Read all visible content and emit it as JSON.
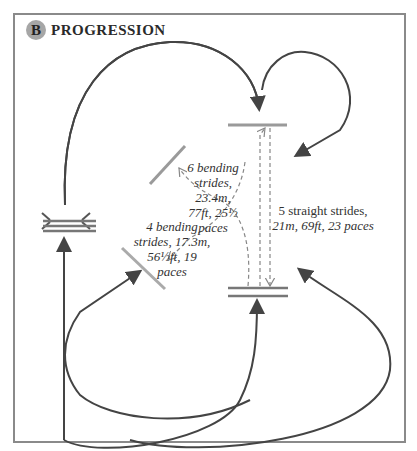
{
  "header": {
    "badge": "B",
    "title": "PROGRESSION"
  },
  "labels": {
    "six_bending": [
      "6 bending",
      "strides, 23.4m,",
      "77ft, 25½",
      "paces"
    ],
    "four_bending": [
      "4 bending",
      "strides, 17.3m,",
      "56½ft, 19",
      "paces"
    ],
    "five_straight": [
      "5 straight strides,",
      "21m, 69ft, 23 paces"
    ]
  },
  "colors": {
    "frame": "#8a8a8a",
    "path": "#444444",
    "pole": "#9a9a9a",
    "dashed": "#888888",
    "badge": "#a6a6a6"
  }
}
